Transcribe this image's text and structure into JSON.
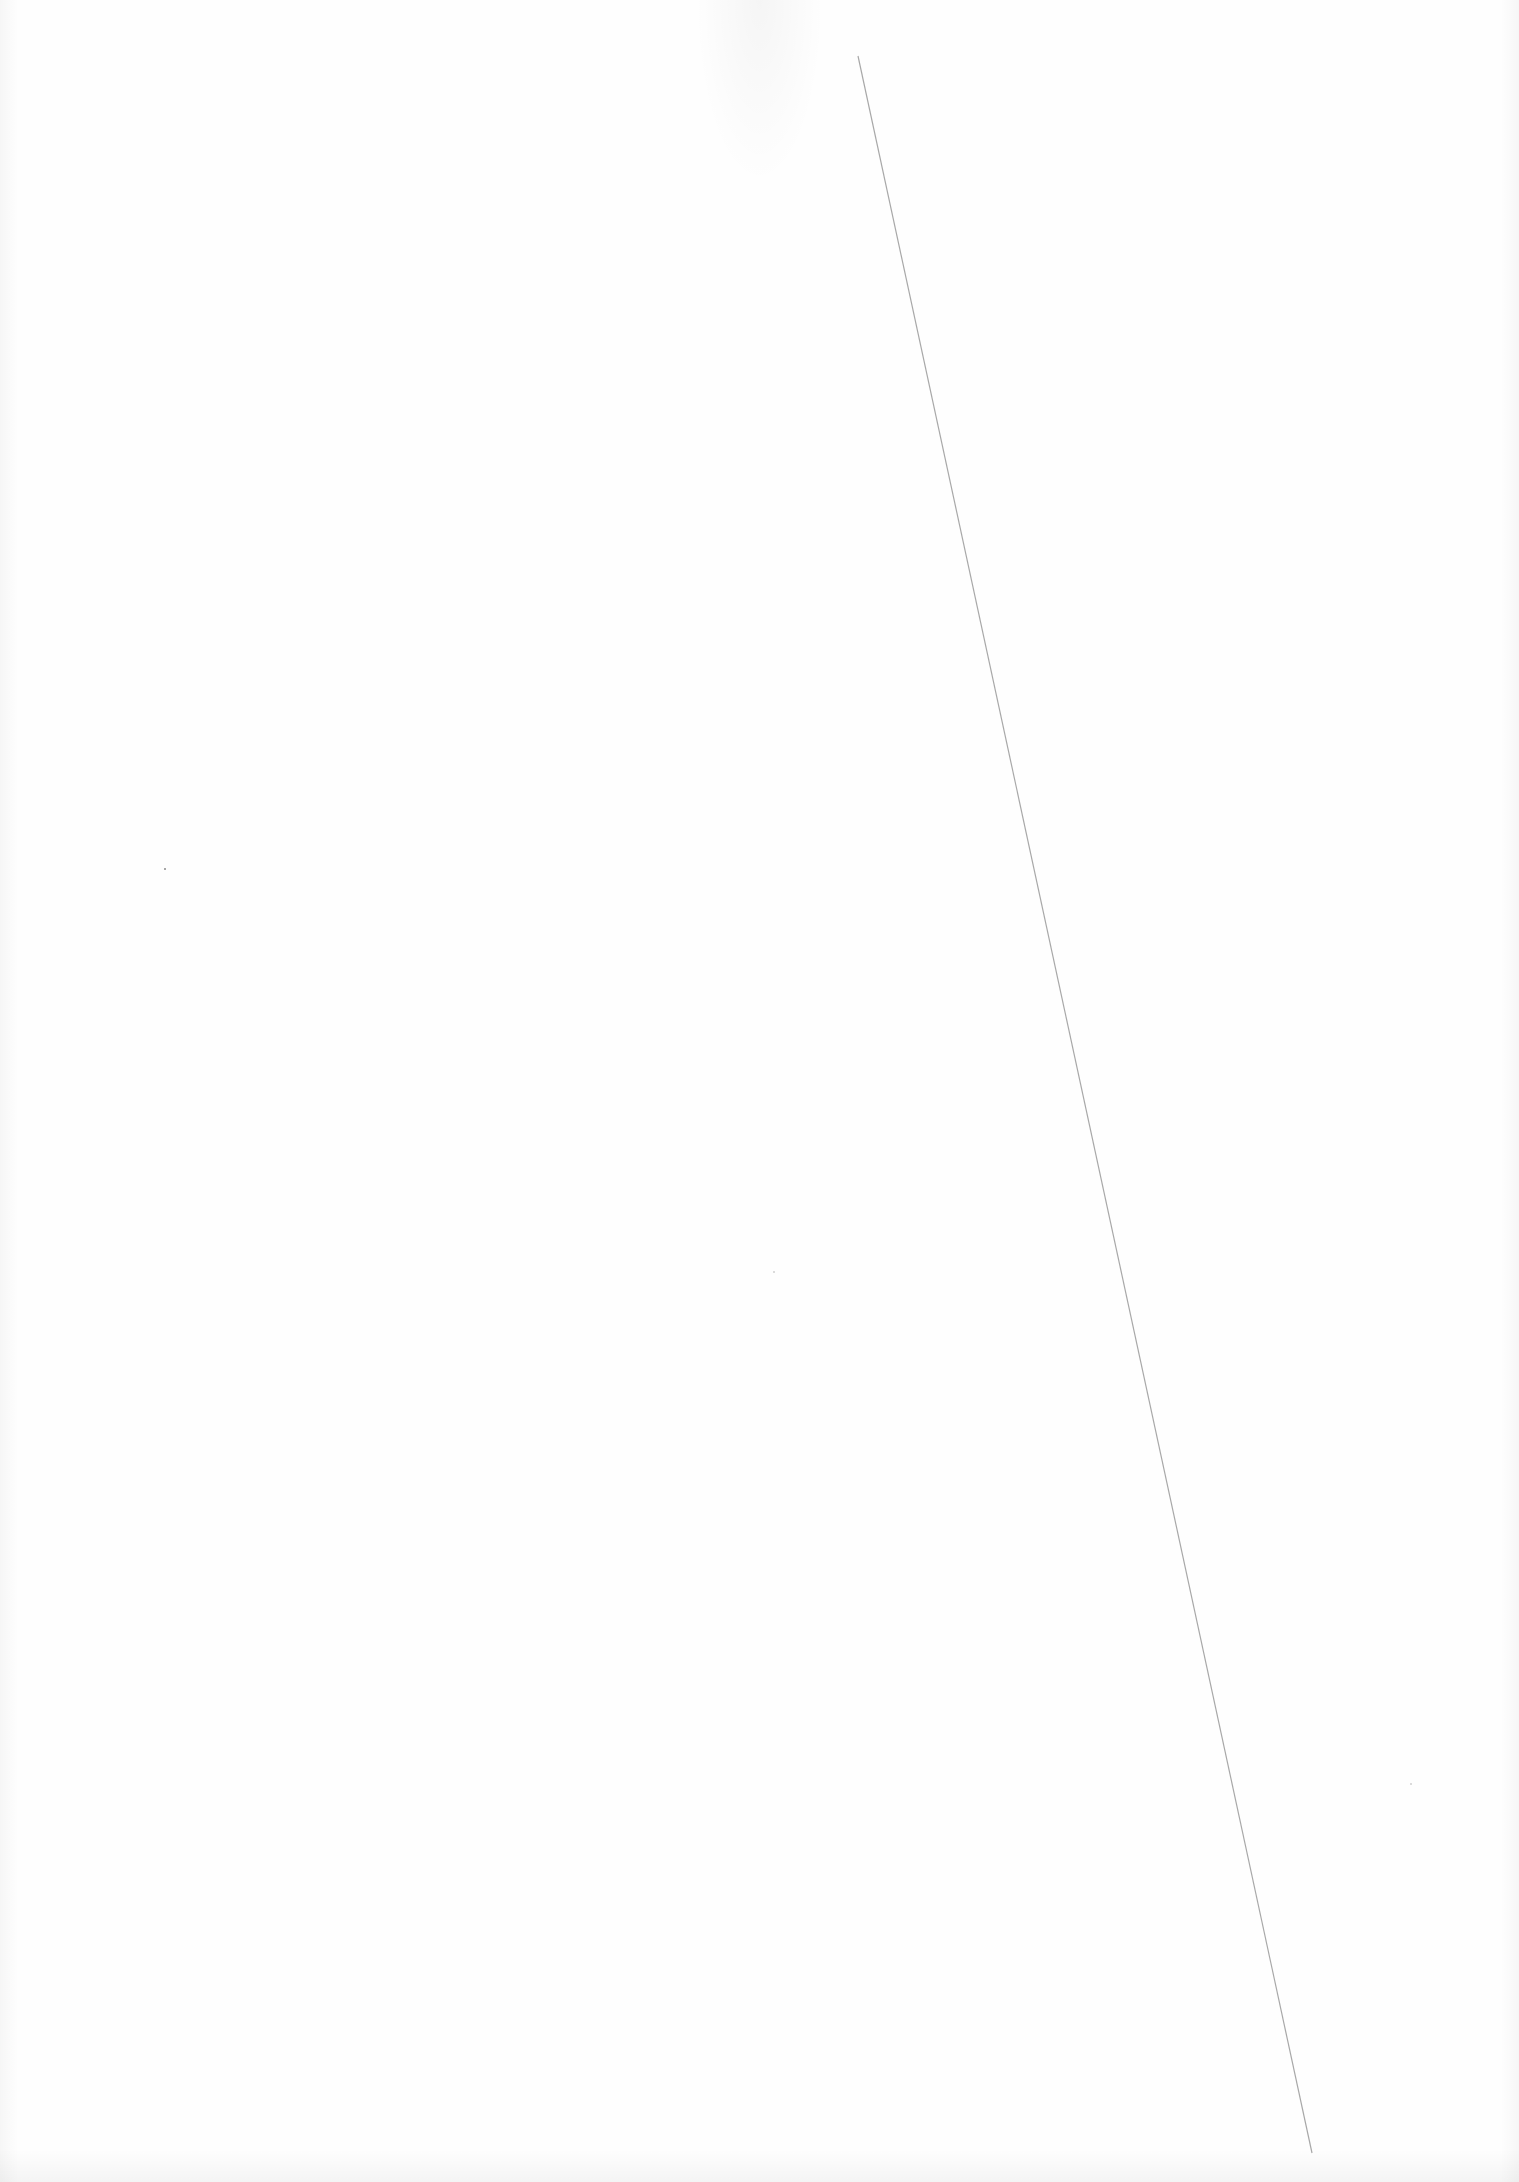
{
  "document": {
    "type": "scanned-blank-page",
    "header_bleed_text": "",
    "line": {
      "x1": 858,
      "y1": 56,
      "x2": 1312,
      "y2": 2153,
      "color": "#a8a8a8"
    },
    "specks": [
      {
        "x": 164,
        "y": 868
      },
      {
        "x": 773,
        "y": 1271
      },
      {
        "x": 1410,
        "y": 1783
      }
    ]
  }
}
